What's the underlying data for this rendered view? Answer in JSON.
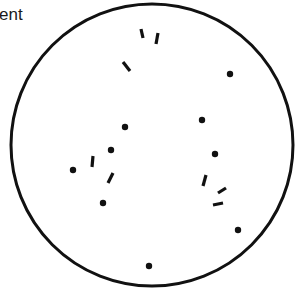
{
  "caption": {
    "text": "ent"
  },
  "diagram": {
    "circle": {
      "cx": 152,
      "cy": 145,
      "r": 141,
      "stroke": "#111111",
      "stroke_width": 3
    },
    "ink_color": "#111111",
    "dots": [
      {
        "x": 230,
        "y": 74
      },
      {
        "x": 125,
        "y": 127
      },
      {
        "x": 202,
        "y": 120
      },
      {
        "x": 111,
        "y": 150
      },
      {
        "x": 215,
        "y": 154
      },
      {
        "x": 73,
        "y": 170
      },
      {
        "x": 103,
        "y": 203
      },
      {
        "x": 238,
        "y": 230
      },
      {
        "x": 149,
        "y": 266
      }
    ],
    "dashes": [
      {
        "x1": 141,
        "y1": 29,
        "x2": 143,
        "y2": 38
      },
      {
        "x1": 158,
        "y1": 33,
        "x2": 156,
        "y2": 44
      },
      {
        "x1": 123,
        "y1": 62,
        "x2": 130,
        "y2": 71
      },
      {
        "x1": 93,
        "y1": 156,
        "x2": 92,
        "y2": 167
      },
      {
        "x1": 113,
        "y1": 173,
        "x2": 108,
        "y2": 183
      },
      {
        "x1": 206,
        "y1": 175,
        "x2": 203,
        "y2": 186
      },
      {
        "x1": 226,
        "y1": 188,
        "x2": 218,
        "y2": 193
      },
      {
        "x1": 213,
        "y1": 205,
        "x2": 223,
        "y2": 203
      }
    ]
  }
}
